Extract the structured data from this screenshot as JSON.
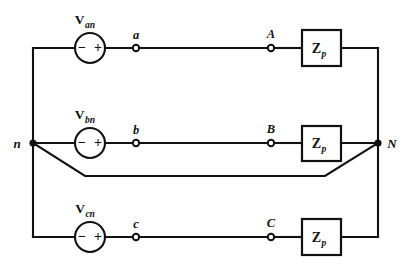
{
  "diagram": {
    "background_color": "#ffffff",
    "line_color": "#111111",
    "phases": [
      {
        "id": "phase-a",
        "source_label_main": "V",
        "source_label_sub": "an",
        "polarity_left": "−",
        "polarity_right": "+",
        "source_terminal": "a",
        "load_terminal": "A",
        "impedance_main": "Z",
        "impedance_sub": "p"
      },
      {
        "id": "phase-b",
        "source_label_main": "V",
        "source_label_sub": "bn",
        "polarity_left": "−",
        "polarity_right": "+",
        "source_terminal": "b",
        "load_terminal": "B",
        "impedance_main": "Z",
        "impedance_sub": "p"
      },
      {
        "id": "phase-c",
        "source_label_main": "V",
        "source_label_sub": "cn",
        "polarity_left": "−",
        "polarity_right": "+",
        "source_terminal": "c",
        "load_terminal": "C",
        "impedance_main": "Z",
        "impedance_sub": "p"
      }
    ],
    "nodes": {
      "source_neutral": "n",
      "load_neutral": "N"
    }
  }
}
